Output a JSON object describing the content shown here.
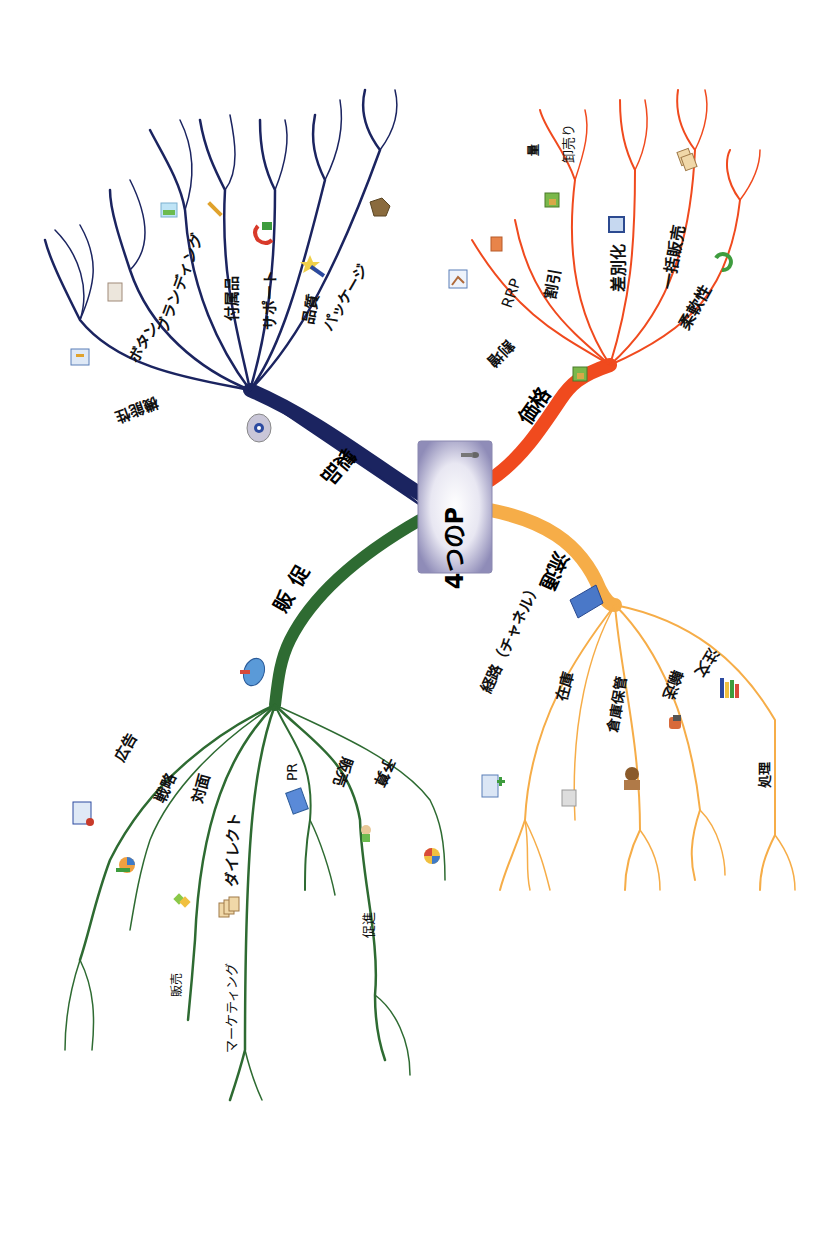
{
  "title": "4つのP",
  "colors": {
    "product": "#1b2460",
    "price": "#f04a1e",
    "place": "#f6ad48",
    "promotion": "#2e6b32",
    "center_box": "#8f8cb8"
  },
  "branches": {
    "product": {
      "label": "製品",
      "icon": "cd-icon",
      "items": [
        {
          "label": "機能性",
          "icon": "wrench-box-icon"
        },
        {
          "label": "ボタン",
          "icon": "document-icon"
        },
        {
          "label": "ブランディング",
          "icon": "image-icon"
        },
        {
          "label": "付属品",
          "icon": "wrench-icon"
        },
        {
          "label": "サポート",
          "icon": "phone-icon"
        },
        {
          "label": "品質",
          "icon": "magic-wand-icon"
        },
        {
          "label": "パッケージ",
          "icon": "package-icon"
        }
      ]
    },
    "price": {
      "label": "価格",
      "icon": "money-icon",
      "items": [
        {
          "label": "割増",
          "icon": "chart-icon"
        },
        {
          "label": "RRP",
          "icon": "calculator-icon"
        },
        {
          "label": "割引",
          "icon": "money-icon"
        },
        {
          "label": "量",
          "icon": ""
        },
        {
          "label": "卸売り",
          "icon": ""
        },
        {
          "label": "差別化",
          "icon": "square-icon"
        },
        {
          "label": "一括販売",
          "icon": "cards-icon"
        },
        {
          "label": "柔軟性",
          "icon": "refresh-icon"
        }
      ]
    },
    "place": {
      "label": "流通",
      "icon": "building-icon",
      "items": [
        {
          "label": "経路（チャネル）",
          "icon": "org-chart-icon"
        },
        {
          "label": "在庫",
          "icon": "list-icon"
        },
        {
          "label": "倉庫保管",
          "icon": "person-icon"
        },
        {
          "label": "輸送",
          "icon": "truck-icon"
        },
        {
          "label": "注文",
          "icon": "bar-chart-icon"
        },
        {
          "label": "処理",
          "icon": ""
        }
      ]
    },
    "promotion": {
      "label": "販促",
      "icon": "shopping-cart-icon",
      "items": [
        {
          "label": "広告",
          "icon": "presentation-icon"
        },
        {
          "label": "戦略",
          "icon": "pie-chart-stack-icon"
        },
        {
          "label": "対面",
          "icon": "puzzle-icon"
        },
        {
          "label": "販売",
          "icon": ""
        },
        {
          "label": "ダイレクト",
          "icon": "documents-icon"
        },
        {
          "label": "マーケティング",
          "icon": ""
        },
        {
          "label": "PR",
          "icon": "newspaper-icon"
        },
        {
          "label": "販売",
          "icon": "presenter-icon"
        },
        {
          "label": "促進",
          "icon": ""
        },
        {
          "label": "予算",
          "icon": "pie-chart-icon"
        }
      ]
    }
  }
}
